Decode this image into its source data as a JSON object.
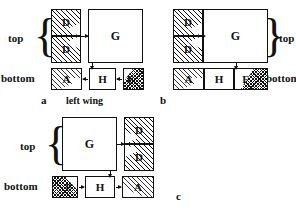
{
  "figure": {
    "caption_left_wing": "left wing",
    "panels": [
      {
        "id": "a",
        "label": "a",
        "side_labels": {
          "top": "top",
          "bottom": "bottom"
        },
        "top_row_boxes": [
          {
            "name": "D-upper",
            "label": "D",
            "fill": "diagonal-hatch"
          },
          {
            "name": "D-lower",
            "label": "D",
            "fill": "diagonal-hatch"
          },
          {
            "name": "G",
            "label": "G",
            "fill": "white"
          }
        ],
        "bottom_row_boxes": [
          {
            "name": "A",
            "label": "A",
            "fill": "hatch-and-stipple"
          },
          {
            "name": "H",
            "label": "H",
            "fill": "white"
          },
          {
            "name": "F",
            "label": "F",
            "fill": "checker"
          }
        ]
      },
      {
        "id": "b",
        "label": "b",
        "side_labels": {
          "top": "top",
          "bottom": "bottom"
        },
        "top_row_boxes": [
          {
            "name": "D-upper",
            "label": "D",
            "fill": "diagonal-hatch"
          },
          {
            "name": "D-lower",
            "label": "D",
            "fill": "diagonal-hatch"
          },
          {
            "name": "G",
            "label": "G",
            "fill": "white"
          }
        ],
        "bottom_row_boxes": [
          {
            "name": "A",
            "label": "A",
            "fill": "hatch-and-stipple"
          },
          {
            "name": "H",
            "label": "H",
            "fill": "white"
          },
          {
            "name": "F",
            "label": "F",
            "fill": "checker"
          }
        ]
      },
      {
        "id": "c",
        "label": "c",
        "side_labels": {
          "top": "top",
          "bottom": "bottom"
        },
        "top_row_boxes": [
          {
            "name": "G",
            "label": "G",
            "fill": "white"
          },
          {
            "name": "D-upper",
            "label": "D",
            "fill": "diagonal-hatch"
          },
          {
            "name": "D-lower",
            "label": "D",
            "fill": "diagonal-hatch"
          }
        ],
        "bottom_row_boxes": [
          {
            "name": "F",
            "label": "F",
            "fill": "checker"
          },
          {
            "name": "H",
            "label": "H",
            "fill": "white"
          },
          {
            "name": "A",
            "label": "A",
            "fill": "hatch-and-stipple"
          }
        ]
      }
    ]
  },
  "colors": {
    "ink": "#111111",
    "paper": "#ffffff"
  }
}
